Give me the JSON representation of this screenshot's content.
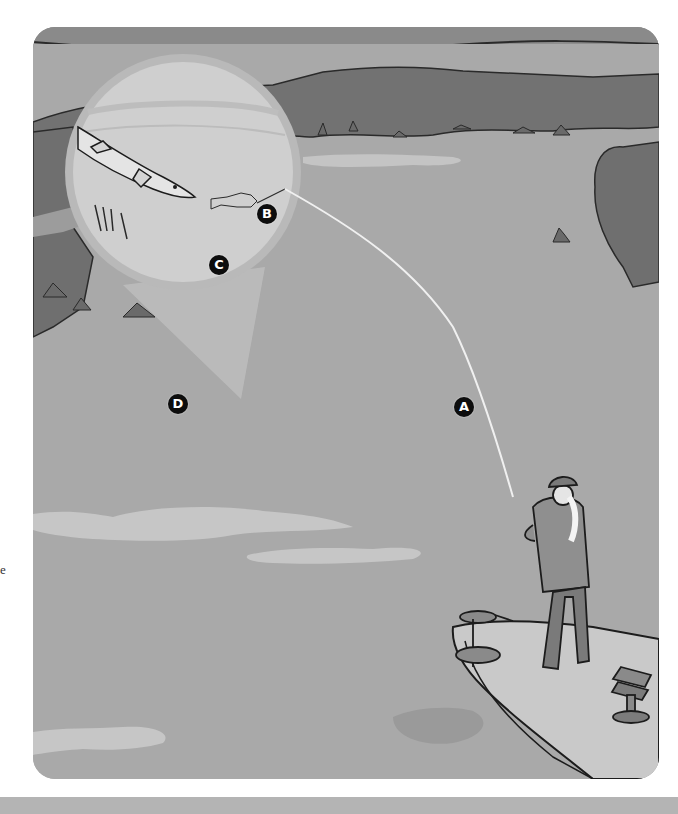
{
  "illustration": {
    "description": "Angler casting from the front deck of a boat toward a weedy shoreline; a magnified circular inset shows a pike approaching a small baitfish lure",
    "palette": {
      "sky": "#8f8f8f",
      "water": "#a9a9a9",
      "water_highlight": "#c6c6c6",
      "treeline": "#727272",
      "inset_water": "#cfcfcf",
      "inset_ring": "#b9b9b9",
      "boat_deck": "#c9c9c9",
      "outline": "#1c1c1c",
      "marker_fill": "#0d0d0d",
      "marker_text": "#ffffff",
      "bottom_bar": "#b4b4b4"
    },
    "markers": [
      {
        "id": "A",
        "label": "A",
        "target": "fishing line"
      },
      {
        "id": "B",
        "label": "B",
        "target": "line end at lure"
      },
      {
        "id": "C",
        "label": "C",
        "target": "lure / baitfish"
      },
      {
        "id": "D",
        "label": "D",
        "target": "area below inset / weed edge"
      }
    ]
  },
  "side_text": "e"
}
